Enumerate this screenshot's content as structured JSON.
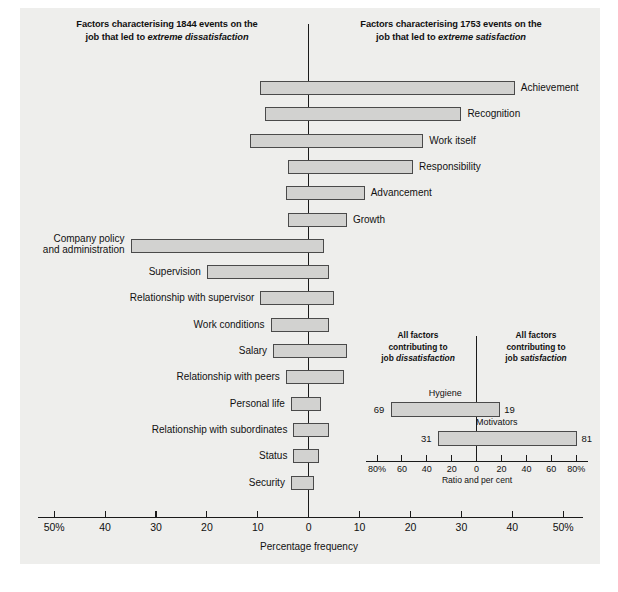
{
  "figure": {
    "headings": {
      "left_line1": "Factors characterising 1844 events on the",
      "left_line2_plain": "job that led to ",
      "left_line2_em": "extreme dissatisfaction",
      "right_line1": "Factors characterising 1753 events on the",
      "right_line2_plain": "job that led to ",
      "right_line2_em": "extreme satisfaction"
    },
    "axis": {
      "title": "Percentage frequency",
      "tick_labels": [
        "50%",
        "40",
        "30",
        "20",
        "10",
        "0",
        "10",
        "20",
        "30",
        "40",
        "50%"
      ],
      "tick_values": [
        -50,
        -40,
        -30,
        -20,
        -10,
        0,
        10,
        20,
        30,
        40,
        50
      ],
      "min": -55,
      "max": 55
    },
    "colors": {
      "bar_fill": "#d2d2d0",
      "bar_stroke": "#4a4a4a",
      "axis": "#1a1a1a",
      "plate": "#eeeeec",
      "text": "#111111"
    }
  },
  "chart_data": {
    "type": "bar",
    "xlabel": "Percentage frequency",
    "ylabel": "",
    "xlim": [
      -55,
      55
    ],
    "grid": false,
    "orientation": "horizontal-diverging",
    "note": "Each factor spans from a dissatisfaction (negative) percentage to a satisfaction (positive) percentage.",
    "categories": [
      "Achievement",
      "Recognition",
      "Work itself",
      "Responsibility",
      "Advancement",
      "Growth",
      "Company policy and administration",
      "Supervision",
      "Relationship with supervisor",
      "Work conditions",
      "Salary",
      "Relationship with peers",
      "Personal life",
      "Relationship with subordinates",
      "Status",
      "Security"
    ],
    "series": [
      {
        "name": "Dissatisfaction (left of zero, %)",
        "values": [
          9.5,
          8.5,
          11.5,
          4.0,
          4.5,
          4.0,
          35.0,
          20.0,
          9.5,
          7.5,
          7.0,
          4.5,
          3.5,
          3.0,
          3.0,
          3.5
        ]
      },
      {
        "name": "Satisfaction (right of zero, %)",
        "values": [
          40.5,
          30.0,
          22.5,
          20.5,
          11.0,
          7.5,
          3.0,
          4.0,
          5.0,
          4.0,
          7.5,
          7.0,
          2.5,
          4.0,
          2.0,
          1.0
        ]
      }
    ],
    "label_sides": [
      "right",
      "right",
      "right",
      "right",
      "right",
      "right",
      "left",
      "left",
      "left",
      "left",
      "left",
      "left",
      "left",
      "left",
      "left",
      "left"
    ]
  },
  "bars": [
    {
      "label": "Achievement",
      "label2": "",
      "neg": 9.5,
      "pos": 40.5,
      "side": "right"
    },
    {
      "label": "Recognition",
      "label2": "",
      "neg": 8.5,
      "pos": 30.0,
      "side": "right"
    },
    {
      "label": "Work itself",
      "label2": "",
      "neg": 11.5,
      "pos": 22.5,
      "side": "right"
    },
    {
      "label": "Responsibility",
      "label2": "",
      "neg": 4.0,
      "pos": 20.5,
      "side": "right"
    },
    {
      "label": "Advancement",
      "label2": "",
      "neg": 4.5,
      "pos": 11.0,
      "side": "right"
    },
    {
      "label": "Growth",
      "label2": "",
      "neg": 4.0,
      "pos": 7.5,
      "side": "right"
    },
    {
      "label": "Company policy",
      "label2": "and administration",
      "neg": 35.0,
      "pos": 3.0,
      "side": "left"
    },
    {
      "label": "Supervision",
      "label2": "",
      "neg": 20.0,
      "pos": 4.0,
      "side": "left"
    },
    {
      "label": "Relationship with supervisor",
      "label2": "",
      "neg": 9.5,
      "pos": 5.0,
      "side": "left"
    },
    {
      "label": "Work conditions",
      "label2": "",
      "neg": 7.5,
      "pos": 4.0,
      "side": "left"
    },
    {
      "label": "Salary",
      "label2": "",
      "neg": 7.0,
      "pos": 7.5,
      "side": "left"
    },
    {
      "label": "Relationship with peers",
      "label2": "",
      "neg": 4.5,
      "pos": 7.0,
      "side": "left"
    },
    {
      "label": "Personal life",
      "label2": "",
      "neg": 3.5,
      "pos": 2.5,
      "side": "left"
    },
    {
      "label": "Relationship with subordinates",
      "label2": "",
      "neg": 3.0,
      "pos": 4.0,
      "side": "left"
    },
    {
      "label": "Status",
      "label2": "",
      "neg": 3.0,
      "pos": 2.0,
      "side": "left"
    },
    {
      "label": "Security",
      "label2": "",
      "neg": 3.5,
      "pos": 1.0,
      "side": "left"
    }
  ],
  "inset": {
    "heading_left_line1": "All factors",
    "heading_left_line2": "contributing to",
    "heading_left_line3_plain": "job ",
    "heading_left_line3_em": "dissatisfaction",
    "heading_right_line1": "All factors",
    "heading_right_line2": "contributing to",
    "heading_right_line3_plain": "job ",
    "heading_right_line3_em": "satisfaction",
    "axis_title": "Ratio and per cent",
    "tick_labels": [
      "80%",
      "60",
      "40",
      "20",
      "0",
      "20",
      "40",
      "60",
      "80%"
    ],
    "tick_values": [
      -80,
      -60,
      -40,
      -20,
      0,
      20,
      40,
      60,
      80
    ],
    "xlim": [
      -95,
      95
    ],
    "bars": [
      {
        "name": "Hygiene",
        "neg": 69,
        "pos": 19,
        "neg_label": "69",
        "pos_label": "19"
      },
      {
        "name": "Motivators",
        "neg": 31,
        "pos": 81,
        "neg_label": "31",
        "pos_label": "81"
      }
    ],
    "chart_data": {
      "type": "bar",
      "title": "All factors contributing to job dissatisfaction / satisfaction",
      "xlabel": "Ratio and per cent",
      "categories": [
        "Hygiene",
        "Motivators"
      ],
      "series": [
        {
          "name": "Contributing to job dissatisfaction (%)",
          "values": [
            69,
            31
          ]
        },
        {
          "name": "Contributing to job satisfaction (%)",
          "values": [
            19,
            81
          ]
        }
      ],
      "xlim": [
        -95,
        95
      ]
    }
  }
}
